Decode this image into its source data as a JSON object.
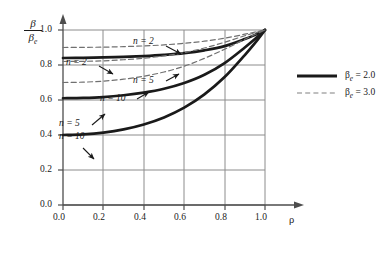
{
  "chart_data": {
    "type": "line",
    "title": "",
    "xlabel": "ρ",
    "ylabel_numerator": "β",
    "ylabel_denominator": "βe",
    "xlim": [
      0.0,
      1.0
    ],
    "ylim": [
      0.0,
      1.0
    ],
    "grid": true,
    "grid_step": 0.2,
    "xticks": [
      "0.0",
      "0.2",
      "0.4",
      "0.6",
      "0.8",
      "1.0"
    ],
    "xtick_values": [
      0.0,
      0.2,
      0.4,
      0.6,
      0.8,
      1.0
    ],
    "yticks": [
      "0.0",
      "0.2",
      "0.4",
      "0.6",
      "0.8",
      "1.0"
    ],
    "ytick_values": [
      0.0,
      0.2,
      0.4,
      0.6,
      0.8,
      1.0
    ],
    "x": [
      0.0,
      0.1,
      0.2,
      0.3,
      0.4,
      0.5,
      0.6,
      0.7,
      0.8,
      0.9,
      0.95,
      1.0
    ],
    "series": [
      {
        "name": "n = 2",
        "style": "solid",
        "beta_e": "2.0",
        "y0": 0.84,
        "values": [
          0.84,
          0.841,
          0.843,
          0.846,
          0.851,
          0.858,
          0.868,
          0.884,
          0.908,
          0.948,
          0.972,
          1.0
        ]
      },
      {
        "name": "n = 5",
        "style": "solid",
        "beta_e": "2.0",
        "y0": 0.61,
        "values": [
          0.61,
          0.612,
          0.617,
          0.627,
          0.642,
          0.664,
          0.697,
          0.744,
          0.811,
          0.9,
          0.948,
          1.0
        ]
      },
      {
        "name": "n = 10",
        "style": "solid",
        "beta_e": "2.0",
        "y0": 0.4,
        "values": [
          0.4,
          0.404,
          0.414,
          0.432,
          0.46,
          0.5,
          0.556,
          0.632,
          0.731,
          0.857,
          0.925,
          1.0
        ]
      },
      {
        "name": "n = 2",
        "style": "dashed",
        "beta_e": "3.0",
        "y0": 0.9,
        "values": [
          0.9,
          0.901,
          0.902,
          0.905,
          0.909,
          0.915,
          0.924,
          0.936,
          0.953,
          0.976,
          0.988,
          1.0
        ]
      },
      {
        "name": "n = 5",
        "style": "dashed",
        "beta_e": "3.0",
        "y0": 0.82,
        "values": [
          0.82,
          0.821,
          0.824,
          0.83,
          0.839,
          0.852,
          0.871,
          0.897,
          0.93,
          0.967,
          0.984,
          1.0
        ]
      },
      {
        "name": "n = 10",
        "style": "dashed",
        "beta_e": "3.0",
        "y0": 0.7,
        "values": [
          0.7,
          0.702,
          0.708,
          0.719,
          0.736,
          0.76,
          0.793,
          0.838,
          0.89,
          0.947,
          0.974,
          1.0
        ]
      }
    ],
    "annotations": [
      {
        "text": "n = 2",
        "series": "n = 2 dashed",
        "tip_x": 0.56,
        "tip_y": 0.9
      },
      {
        "text": "n = 2",
        "series": "n = 2 solid",
        "tip_x": 0.22,
        "tip_y": 0.843
      },
      {
        "text": "n = 5",
        "series": "n = 5 dashed",
        "tip_x": 0.555,
        "tip_y": 0.866
      },
      {
        "text": "n = 10",
        "series": "n = 10 dashed",
        "tip_x": 0.4,
        "tip_y": 0.736
      },
      {
        "text": "n = 5",
        "series": "n = 5 solid",
        "tip_x": 0.205,
        "tip_y": 0.618
      },
      {
        "text": "n = 10",
        "series": "n = 10 solid",
        "tip_x": 0.165,
        "tip_y": 0.411
      }
    ],
    "legend": {
      "position": "right",
      "entries": [
        {
          "label": "βe = 2.0",
          "style": "solid",
          "symbol_text": "β",
          "sub": "e",
          "rest": " = 2.0"
        },
        {
          "label": "βe = 3.0",
          "style": "dashed",
          "symbol_text": "β",
          "sub": "e",
          "rest": " = 3.0"
        }
      ]
    },
    "colors": {
      "curve": "#1a1a1a",
      "grid": "#808080",
      "axis": "#4d4d4d",
      "text": "#1a1a1a",
      "background": "#ffffff"
    }
  }
}
